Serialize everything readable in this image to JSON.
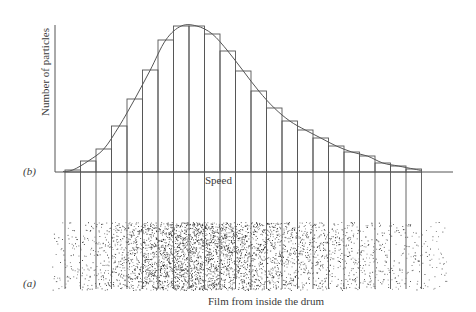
{
  "chart_data": {
    "type": "bar",
    "subtype": "histogram-with-fitted-curve",
    "title": "",
    "panels": [
      {
        "id": "b",
        "label": "(b)",
        "description": "Histogram of particle speeds with smooth Maxwell-like distribution curve"
      },
      {
        "id": "a",
        "label": "(a)",
        "description": "Film from inside the drum showing deposited particle density"
      }
    ],
    "xlabel": "Speed",
    "ylabel": "Number of particles",
    "caption": "Film from inside the drum",
    "bin_count": 23,
    "categories": [
      "1",
      "2",
      "3",
      "4",
      "5",
      "6",
      "7",
      "8",
      "9",
      "10",
      "11",
      "12",
      "13",
      "14",
      "15",
      "16",
      "17",
      "18",
      "19",
      "20",
      "21",
      "22",
      "23"
    ],
    "values": [
      2,
      11,
      23,
      46,
      73,
      102,
      132,
      146,
      146,
      138,
      121,
      101,
      81,
      64,
      51,
      42,
      34,
      26,
      20,
      16,
      9,
      6,
      3
    ],
    "value_units": "relative (pixel height, max ≈147)",
    "ylim": [
      0,
      147
    ],
    "grid": false,
    "legend": null,
    "ticks": {
      "x": [],
      "y": []
    },
    "curve": "smooth distribution curve overlaid on histogram, peak near bins 8–9"
  },
  "labels": {
    "panel_b": "(b)",
    "panel_a": "(a)",
    "ylabel": "Number of particles",
    "xlabel": "Speed",
    "caption": "Film from inside the drum"
  },
  "colors": {
    "line": "#555555",
    "curve": "#555555",
    "dots": "#111111",
    "background": "#ffffff"
  },
  "layout": {
    "axis_x0": 55,
    "axis_top": 25,
    "baseline_y": 172,
    "axis_x_end": 453,
    "bins_x0": 65,
    "bin_width": 15.5,
    "px_per_unit": 1,
    "film": {
      "x0": 52,
      "x1": 447,
      "y0": 222,
      "y1": 290
    },
    "drop_line_bottom": 289
  }
}
